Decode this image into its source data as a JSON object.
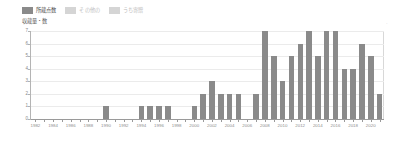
{
  "legend": {
    "items": [
      {
        "label": "所蔵点数",
        "color": "#8a8a8a",
        "active": true
      },
      {
        "label": "その他の",
        "color": "#d5d5d5",
        "active": false
      },
      {
        "label": "うち寄贈",
        "color": "#d5d5d5",
        "active": false
      }
    ]
  },
  "axis_title": "収蔵量・数",
  "corner_glyph": "·",
  "chart_data": {
    "type": "bar",
    "title": "",
    "subtitle": "",
    "xlabel": "",
    "ylabel": "収蔵量・数",
    "ylim": [
      0,
      7
    ],
    "yticks": [
      0,
      1,
      2,
      3,
      4,
      5,
      6,
      7
    ],
    "ytick_labels": [
      "0",
      "1",
      "2",
      "3",
      "4",
      "5",
      "6",
      "7"
    ],
    "grid": true,
    "legend_position": "top-left",
    "bar_color": "#8a8a8a",
    "categories": [
      "1982",
      "1983",
      "1984",
      "1985",
      "1986",
      "1987",
      "1988",
      "1989",
      "1990",
      "1991",
      "1992",
      "1993",
      "1994",
      "1995",
      "1996",
      "1997",
      "1998",
      "1999",
      "2000",
      "2001",
      "2002",
      "2003",
      "2004",
      "2005",
      "2006",
      "2007",
      "2008",
      "2009",
      "2010",
      "2011",
      "2012",
      "2013",
      "2014",
      "2015",
      "2016",
      "2017",
      "2018",
      "2019",
      "2020",
      "2021"
    ],
    "xtick_labels": [
      "1982",
      "1984",
      "1986",
      "1988",
      "1990",
      "1992",
      "1994",
      "1996",
      "1998",
      "2000",
      "2002",
      "2004",
      "2006",
      "2008",
      "2010",
      "2012",
      "2014",
      "2016",
      "2018",
      "2020"
    ],
    "series": [
      {
        "name": "所蔵点数",
        "values": [
          0,
          0,
          0,
          0,
          0,
          0,
          0,
          0,
          1,
          0,
          0,
          0,
          1,
          1,
          1,
          1,
          0,
          0,
          1,
          2,
          3,
          2,
          2,
          2,
          0,
          2,
          7,
          5,
          3,
          5,
          6,
          7,
          5,
          7,
          7,
          4,
          4,
          6,
          5,
          2
        ]
      }
    ]
  }
}
